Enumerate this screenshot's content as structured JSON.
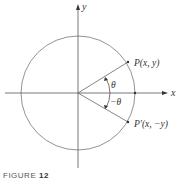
{
  "figure": {
    "caption_prefix": "FIGURE",
    "caption_number": "12"
  },
  "axes": {
    "x_label": "x",
    "y_label": "y"
  },
  "points": {
    "p_label": "P(x, y)",
    "p_prime_label": "P′(x, −y)"
  },
  "angles": {
    "theta_label": "θ",
    "neg_theta_label": "−θ"
  },
  "colors": {
    "line": "#555555",
    "text": "#333333"
  }
}
